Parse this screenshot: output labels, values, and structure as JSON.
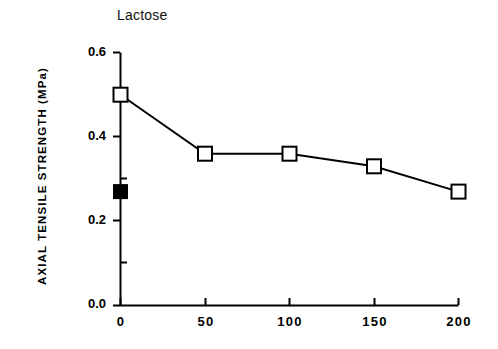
{
  "chart_data": {
    "type": "line",
    "title": "Lactose",
    "xlabel": "",
    "ylabel": "AXIAL  TENSILE  STRENGTH  (MPa)",
    "xlim": [
      0,
      200
    ],
    "ylim": [
      0.0,
      0.6
    ],
    "grid": false,
    "legend": "none",
    "x_ticks": [
      "0",
      "50",
      "100",
      "150",
      "200"
    ],
    "x_tick_values": [
      0,
      50,
      100,
      150,
      200
    ],
    "y_ticks": [
      "0.0",
      "0.2",
      "0.4",
      "0.6"
    ],
    "y_tick_values": [
      0.0,
      0.2,
      0.4,
      0.6
    ],
    "series": [
      {
        "name": "open-square-series",
        "marker": "open-square",
        "x": [
          0,
          50,
          100,
          150,
          200
        ],
        "values": [
          0.5,
          0.36,
          0.36,
          0.33,
          0.27
        ]
      },
      {
        "name": "filled-square-point",
        "marker": "filled-square",
        "x": [
          0
        ],
        "values": [
          0.27
        ]
      }
    ],
    "colors": {
      "line": "#000000",
      "marker_fill_open": "#ffffff",
      "marker_fill_closed": "#000000",
      "axis": "#000000",
      "background": "#ffffff"
    }
  }
}
